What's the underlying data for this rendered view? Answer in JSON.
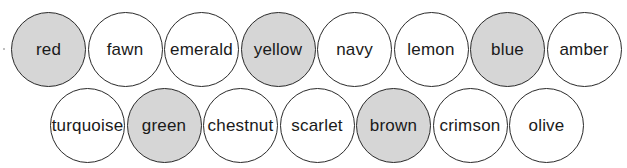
{
  "colors": {
    "shaded": "#d6d6d6",
    "unshaded": "#ffffff",
    "outline": "#2a2a2a"
  },
  "rows": [
    [
      {
        "label": "red",
        "shaded": true
      },
      {
        "label": "fawn",
        "shaded": false
      },
      {
        "label": "emerald",
        "shaded": false
      },
      {
        "label": "yellow",
        "shaded": true
      },
      {
        "label": "navy",
        "shaded": false
      },
      {
        "label": "lemon",
        "shaded": false
      },
      {
        "label": "blue",
        "shaded": true
      },
      {
        "label": "amber",
        "shaded": false
      }
    ],
    [
      {
        "label": "turquoise",
        "shaded": false
      },
      {
        "label": "green",
        "shaded": true
      },
      {
        "label": "chestnut",
        "shaded": false
      },
      {
        "label": "scarlet",
        "shaded": false
      },
      {
        "label": "brown",
        "shaded": true
      },
      {
        "label": "crimson",
        "shaded": false
      },
      {
        "label": "olive",
        "shaded": false
      }
    ]
  ]
}
